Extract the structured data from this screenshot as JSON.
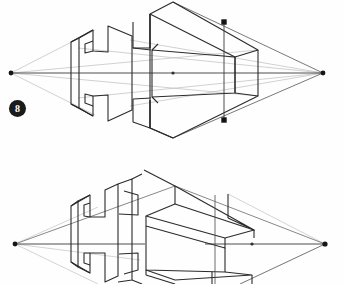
{
  "document": {
    "title": "Two-Point Perspective Construction of an H-Block",
    "background_color": "#fefefe",
    "ink_color": "#2b2b2b",
    "construction_line_color": "#b9b9b9",
    "page_width": 343,
    "page_height": 284
  },
  "figures": [
    {
      "number": "8",
      "label_text": "8",
      "caption": "",
      "name": "figure-8-h-block-perspective",
      "description": "Two-point perspective wireframe: flat H-shaped profile plate on the left joined to a receding rectangular block on the right, with convergence lines running to left and right vanishing points on the horizon.",
      "horizon": {
        "y": 73,
        "left_vp_x": 11,
        "right_vp_x": 323
      },
      "vanishing_points": [
        {
          "name": "left-vanishing-point",
          "x": 11,
          "y": 73
        },
        {
          "name": "right-vanishing-point",
          "x": 323,
          "y": 73
        }
      ],
      "measure_line": {
        "name": "vertical-measure-line",
        "x": 224,
        "y_top": 22,
        "y_bottom": 120
      },
      "marker_points": [
        {
          "name": "upper-measure-point",
          "x": 224,
          "y": 22
        },
        {
          "name": "lower-measure-point",
          "x": 224,
          "y": 120
        },
        {
          "name": "center-horizon-point",
          "x": 173,
          "y": 73
        }
      ]
    },
    {
      "number": "9",
      "label_text": "9",
      "caption": "",
      "name": "figure-9-h-block-perspective",
      "description": "Two-point perspective wireframe: three-dimensional H-shaped block given thickness on the left and a shelved rectangular volume on the right, with envelope lines converging to both vanishing points.",
      "horizon": {
        "y": 244,
        "left_vp_x": 15,
        "right_vp_x": 325
      },
      "vanishing_points": [
        {
          "name": "left-vanishing-point",
          "x": 15,
          "y": 244
        },
        {
          "name": "right-vanishing-point",
          "x": 325,
          "y": 244
        }
      ],
      "measure_line": {
        "name": "vertical-measure-line",
        "x": 215,
        "y_top": 195,
        "y_bottom": 284
      },
      "marker_points": [
        {
          "name": "center-horizon-point",
          "x": 180,
          "y": 244
        }
      ]
    }
  ]
}
